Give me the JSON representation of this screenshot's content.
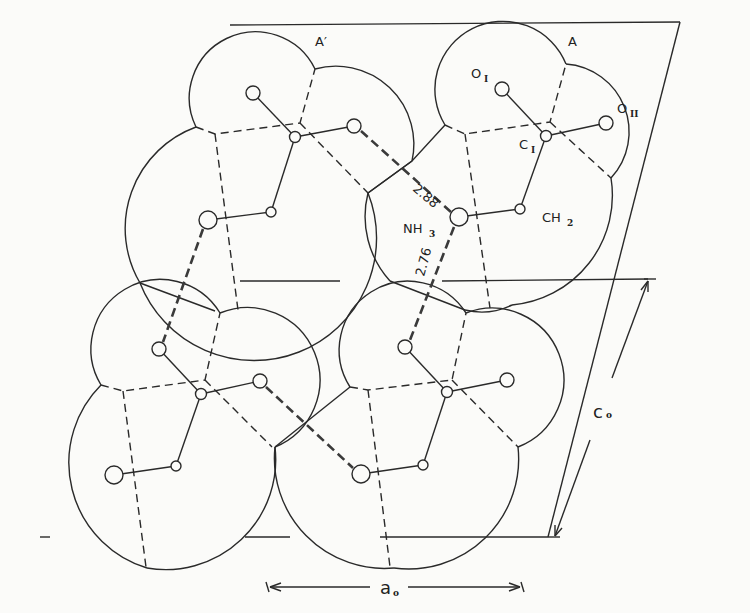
{
  "figure": {
    "molecule_labels": {
      "molecule_a_prime": "A′",
      "molecule_a": "A"
    },
    "atom_labels": {
      "o1": "O",
      "o1_sub": "I",
      "o2": "O",
      "o2_sub": "II",
      "c1": "C",
      "c1_sub": "I",
      "ch2": "CH",
      "ch2_sub": "2",
      "nh3": "NH",
      "nh3_sub": "3"
    },
    "distances": {
      "hbond_upper": "2.88",
      "hbond_lower": "2.76"
    },
    "axes": {
      "a_axis": "a",
      "a_axis_sub": "o",
      "c_axis": "c",
      "c_axis_sub": "o"
    }
  }
}
